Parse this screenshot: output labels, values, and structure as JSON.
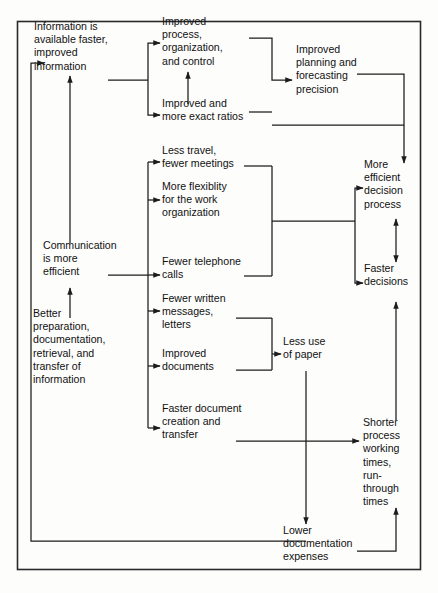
{
  "diagram": {
    "type": "flowchart",
    "frame": {
      "border_color": "#2a2a2a",
      "background_color": "#fdfdfc"
    },
    "line_color": "#1c1c1c",
    "text_color": "#111111",
    "nodes": [
      {
        "id": "information-available",
        "lines": [
          "Information is",
          "available faster,",
          "improved",
          "information"
        ],
        "x": 34,
        "y": 30,
        "align": "start"
      },
      {
        "id": "improved-process",
        "lines": [
          "Improved",
          "process,",
          "organization,",
          "and control"
        ],
        "x": 162,
        "y": 25,
        "align": "start"
      },
      {
        "id": "improved-ratios",
        "lines": [
          "Improved and",
          "more exact ratios"
        ],
        "x": 162,
        "y": 107,
        "align": "start"
      },
      {
        "id": "improved-planning",
        "lines": [
          "Improved",
          "planning and",
          "forecasting",
          "precision"
        ],
        "x": 296,
        "y": 53,
        "align": "start"
      },
      {
        "id": "less-travel",
        "lines": [
          "Less travel,",
          "fewer meetings"
        ],
        "x": 162,
        "y": 154,
        "align": "start"
      },
      {
        "id": "more-flexibility",
        "lines": [
          "More flexiblity",
          "for the work",
          "organization"
        ],
        "x": 162,
        "y": 190,
        "align": "start"
      },
      {
        "id": "fewer-telephone",
        "lines": [
          "Fewer telephone",
          "calls"
        ],
        "x": 162,
        "y": 265,
        "align": "start"
      },
      {
        "id": "fewer-written",
        "lines": [
          "Fewer written",
          "messages,",
          "letters"
        ],
        "x": 162,
        "y": 302,
        "align": "start"
      },
      {
        "id": "improved-documents",
        "lines": [
          "Improved",
          "documents"
        ],
        "x": 162,
        "y": 357,
        "align": "start"
      },
      {
        "id": "faster-document",
        "lines": [
          "Faster document",
          "creation and",
          "transfer"
        ],
        "x": 162,
        "y": 412,
        "align": "start"
      },
      {
        "id": "communication-efficient",
        "lines": [
          "Communication",
          "is more",
          "efficient"
        ],
        "x": 43,
        "y": 249,
        "align": "start"
      },
      {
        "id": "better-preparation",
        "lines": [
          "Better",
          "preparation,",
          "documentation,",
          "retrieval, and",
          "transfer of",
          "information"
        ],
        "x": 33,
        "y": 317,
        "align": "start"
      },
      {
        "id": "less-paper",
        "lines": [
          "Less use",
          "of paper"
        ],
        "x": 283,
        "y": 345,
        "align": "start"
      },
      {
        "id": "more-efficient-decision",
        "lines": [
          "More",
          "efficient",
          "decision",
          "process"
        ],
        "x": 364,
        "y": 168,
        "align": "start"
      },
      {
        "id": "faster-decisions",
        "lines": [
          "Faster",
          "decisions"
        ],
        "x": 364,
        "y": 272,
        "align": "start"
      },
      {
        "id": "shorter-process",
        "lines": [
          "Shorter",
          "process",
          "working",
          "times,",
          "run-",
          "through",
          "times"
        ],
        "x": 363,
        "y": 426,
        "align": "start"
      },
      {
        "id": "lower-documentation",
        "lines": [
          "Lower",
          "documentation",
          "expenses"
        ],
        "x": 283,
        "y": 534,
        "align": "start"
      }
    ],
    "edges": [
      {
        "id": "info-to-split",
        "from": "information-available",
        "to": "process-split"
      },
      {
        "id": "split-to-improved-process",
        "from": "process-split",
        "to": "improved-process"
      },
      {
        "id": "split-to-improved-ratios",
        "from": "process-split",
        "to": "improved-ratios"
      },
      {
        "id": "ratios-to-process",
        "from": "improved-ratios",
        "to": "improved-process"
      },
      {
        "id": "process-merge-to-planning",
        "from": "improved-process",
        "to": "improved-planning"
      },
      {
        "id": "planning-to-decision",
        "from": "improved-planning",
        "to": "more-efficient-decision"
      },
      {
        "id": "ratios-to-decision",
        "from": "improved-ratios",
        "to": "more-efficient-decision"
      },
      {
        "id": "communication-to-spine",
        "from": "communication-efficient",
        "to": "communication-spine"
      },
      {
        "id": "spine-to-less-travel",
        "from": "communication-spine",
        "to": "less-travel"
      },
      {
        "id": "spine-to-more-flexibility",
        "from": "communication-spine",
        "to": "more-flexibility"
      },
      {
        "id": "spine-to-fewer-telephone",
        "from": "communication-spine",
        "to": "fewer-telephone"
      },
      {
        "id": "spine-to-fewer-written",
        "from": "communication-spine",
        "to": "fewer-written"
      },
      {
        "id": "spine-to-improved-documents",
        "from": "communication-spine",
        "to": "improved-documents"
      },
      {
        "id": "spine-to-faster-document",
        "from": "communication-spine",
        "to": "faster-document"
      },
      {
        "id": "travel-flex-phone-merge",
        "from": "less-travel",
        "to": "decision-split"
      },
      {
        "id": "decision-split-to-efficient",
        "from": "decision-split",
        "to": "more-efficient-decision"
      },
      {
        "id": "decision-split-to-faster",
        "from": "decision-split",
        "to": "faster-decisions"
      },
      {
        "id": "efficient-faster-double",
        "from": "more-efficient-decision",
        "to": "faster-decisions",
        "bidirectional": true
      },
      {
        "id": "written-documents-to-paper",
        "from": "fewer-written",
        "to": "less-paper"
      },
      {
        "id": "paper-to-lower-documentation",
        "from": "less-paper",
        "to": "lower-documentation"
      },
      {
        "id": "faster-document-to-shorter",
        "from": "faster-document",
        "to": "shorter-process"
      },
      {
        "id": "lower-documentation-to-shorter",
        "from": "lower-documentation",
        "to": "shorter-process"
      },
      {
        "id": "shorter-to-faster-decisions",
        "from": "shorter-process",
        "to": "faster-decisions"
      },
      {
        "id": "feedback-to-information",
        "from": "lower-documentation",
        "to": "information-available"
      },
      {
        "id": "communication-to-information",
        "from": "communication-efficient",
        "to": "information-available"
      },
      {
        "id": "better-to-communication",
        "from": "better-preparation",
        "to": "communication-efficient"
      }
    ]
  }
}
